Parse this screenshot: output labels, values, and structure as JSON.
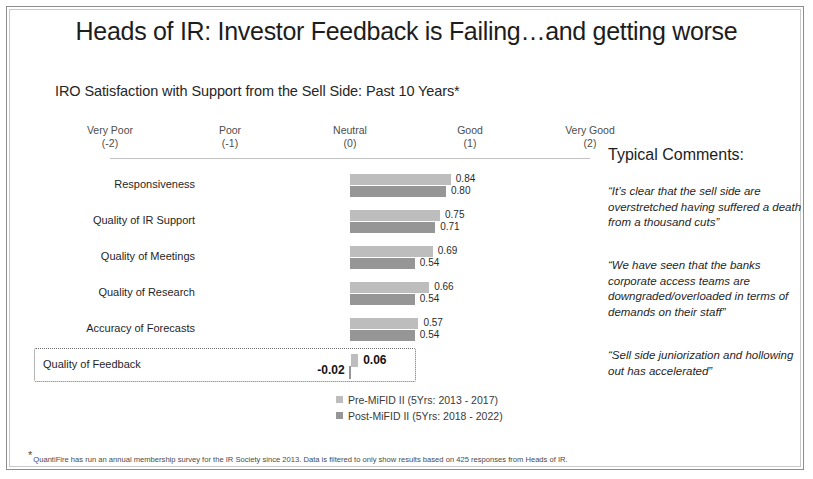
{
  "slide": {
    "title": "Heads of IR: Investor Feedback is Failing…and getting worse",
    "subtitle": "IRO Satisfaction with Support from the Sell Side: Past 10 Years*",
    "footnote_marker": "*",
    "footnote": "QuantiFire has run an annual membership survey for the IR Society since 2013. Data is filtered to only show results based on 425 responses from Heads of IR."
  },
  "comments": {
    "heading": "Typical Comments:",
    "quotes": [
      "“It’s clear that the sell side are overstretched having suffered a death from a thousand cuts”",
      "“We have seen that the banks corporate access teams are downgraded/overloaded in terms of demands on their staff”",
      "“Sell side juniorization and hollowing out has accelerated”"
    ]
  },
  "chart_data": {
    "type": "bar",
    "orientation": "horizontal",
    "title": "IRO Satisfaction with Support from the Sell Side: Past 10 Years*",
    "xlabel": "",
    "ylabel": "",
    "xlim": [
      -2,
      2
    ],
    "grid": false,
    "legend_position": "bottom",
    "scale_ticks": [
      {
        "label": "Very Poor",
        "value": "(-2)",
        "num": -2
      },
      {
        "label": "Poor",
        "value": "(-1)",
        "num": -1
      },
      {
        "label": "Neutral",
        "value": "(0)",
        "num": 0
      },
      {
        "label": "Good",
        "value": "(1)",
        "num": 1
      },
      {
        "label": "Very Good",
        "value": "(2)",
        "num": 2
      }
    ],
    "categories": [
      "Responsiveness",
      "Quality of IR Support",
      "Quality of Meetings",
      "Quality of Research",
      "Accuracy of Forecasts",
      "Quality of Feedback"
    ],
    "series": [
      {
        "name": "Pre-MiFID II (5Yrs: 2013 - 2017)",
        "color": "#bdbdbd",
        "values": [
          0.84,
          0.75,
          0.69,
          0.66,
          0.57,
          0.06
        ],
        "labels": [
          "0.84",
          "0.75",
          "0.69",
          "0.66",
          "0.57",
          "0.06"
        ]
      },
      {
        "name": "Post-MiFID II (5Yrs: 2018 - 2022)",
        "color": "#969696",
        "values": [
          0.8,
          0.71,
          0.54,
          0.54,
          0.54,
          -0.02
        ],
        "labels": [
          "0.80",
          "0.71",
          "0.54",
          "0.54",
          "0.54",
          "-0.02"
        ]
      }
    ],
    "highlighted_category": "Quality of Feedback"
  }
}
